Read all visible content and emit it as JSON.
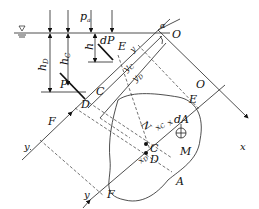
{
  "figure": {
    "labels": {
      "pa": "p",
      "pa_sub": "a",
      "alpha": "α",
      "O_top": "O",
      "O_right": "O",
      "h": "h",
      "hC": "h",
      "hC_sub": "C",
      "hD": "h",
      "hD_sub": "D",
      "dP": "dP",
      "P": "P",
      "E_top": "E",
      "E_right": "E",
      "C_top": "C",
      "D_top": "D",
      "F_left": "F",
      "F_bottom": "F",
      "y_left": "y",
      "y_bottom": "y",
      "y": "y",
      "yC": "y",
      "yC_sub": "C",
      "yD": "y",
      "yD_sub": "D",
      "x": "x",
      "xC": "x",
      "xC_sub": "C",
      "xD": "x",
      "xD_sub": "D",
      "x_small": "x",
      "N": "N",
      "C_center": "C",
      "D_center": "D",
      "dA": "dA",
      "M": "M",
      "A": "A",
      "free_surface_symbol": "▽"
    }
  }
}
